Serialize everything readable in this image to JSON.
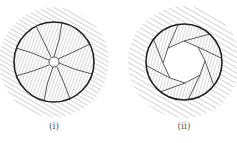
{
  "figures": [
    {
      "id": "i",
      "label": "(i)",
      "description": "Iris diaphragm nearly closed, small central aperture",
      "aperture_radius": 5,
      "blades": 8
    },
    {
      "id": "ii",
      "label": "(ii)",
      "description": "Iris diaphragm open, large octagonal aperture",
      "aperture_radius": 20,
      "blades": 8
    }
  ],
  "colors": {
    "line": "#222222",
    "hatch": "#777777",
    "background": "#ffffff"
  }
}
